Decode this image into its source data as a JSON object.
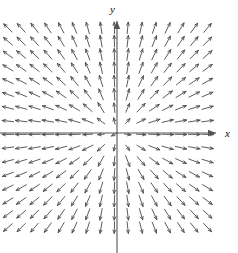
{
  "figure": {
    "type": "vector-field-plot",
    "width": 238,
    "height": 253,
    "background_color": "#ffffff"
  },
  "axes": {
    "x_label": "x",
    "y_label": "y",
    "origin_px": {
      "x": 117,
      "y": 133
    },
    "axis_color": "#555555",
    "axis_line_width": 1.1,
    "x_axis": {
      "name": "x-axis",
      "start_px": {
        "x": 0,
        "y": 133
      },
      "end_px": {
        "x": 216,
        "y": 133
      },
      "arrowhead": "right"
    },
    "y_axis": {
      "name": "y-axis",
      "start_px": {
        "x": 117,
        "y": 253
      },
      "end_px": {
        "x": 117,
        "y": 21
      },
      "arrowhead": "up"
    }
  },
  "chart_data": {
    "type": "scatter",
    "subtype": "vector-field-quiver",
    "title": "",
    "xlabel": "x",
    "ylabel": "y",
    "grid": false,
    "legend": null,
    "field_description": "Radially outward unit vector field; every arrow points directly away from the origin.",
    "field_formula": "F(x, y) = (x, y) / sqrt(x^2 + y^2)",
    "xlim": [
      -8.5,
      7.5
    ],
    "ylim": [
      -8.0,
      8.0
    ],
    "grid_columns": 16,
    "grid_rows": 16,
    "grid_spacing_px": 13.3,
    "field_extent_px": {
      "left": 8,
      "right": 218,
      "top": 28,
      "bottom": 240
    },
    "arrow_color": "#4a4a4a",
    "arrow_line_width": 0.9,
    "arrow_length_px": 11.5,
    "arrow_head_px": 3.4,
    "arrow_direction": "outward-radial",
    "arrowhead_at": "tip-away-from-origin",
    "quadrant_directions": [
      {
        "quadrant": "I",
        "range": "x>0, y>0",
        "direction": "up-right"
      },
      {
        "quadrant": "II",
        "range": "x<0, y>0",
        "direction": "up-left"
      },
      {
        "quadrant": "III",
        "range": "x<0, y<0",
        "direction": "down-left"
      },
      {
        "quadrant": "IV",
        "range": "x>0, y<0",
        "direction": "down-right"
      }
    ],
    "axis_directions": [
      {
        "axis": "positive-x",
        "direction": "right"
      },
      {
        "axis": "negative-x",
        "direction": "left"
      },
      {
        "axis": "positive-y",
        "direction": "up"
      },
      {
        "axis": "negative-y",
        "direction": "down"
      }
    ]
  }
}
